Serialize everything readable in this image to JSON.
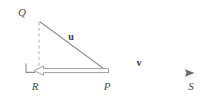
{
  "figure": {
    "points": [
      {
        "id": "Q",
        "label": "Q",
        "x": 39,
        "y": 21,
        "label_x": 25,
        "label_y": 15
      },
      {
        "id": "R",
        "label": "R",
        "x": 39,
        "y": 73,
        "label_x": 35,
        "label_y": 89
      },
      {
        "id": "P",
        "label": "P",
        "x": 109,
        "y": 73,
        "label_x": 106,
        "label_y": 89
      },
      {
        "id": "S",
        "label": "S",
        "x": 193,
        "y": 73,
        "label_x": 190,
        "label_y": 89
      }
    ],
    "vectors": [
      {
        "id": "u",
        "label": "u",
        "from": "P",
        "to": "Q",
        "label_x": 71,
        "label_y": 39
      },
      {
        "id": "v",
        "label": "v",
        "from": "P",
        "to": "S",
        "label_x": 139,
        "label_y": 65
      }
    ],
    "segments": {
      "baseline": {
        "x1": 8,
        "y1": 73,
        "x2": 212,
        "y2": 73
      },
      "hypotenuse": {
        "x1": 39,
        "y1": 21,
        "x2": 109,
        "y2": 73
      },
      "vertical_dashed": {
        "x1": 39,
        "y1": 21,
        "x2": 39,
        "y2": 73
      },
      "projection": {
        "x1": 109,
        "y1": 71,
        "x2": 41,
        "y2": 71
      }
    },
    "right_angle_marker": {
      "x": 26,
      "y": 62,
      "size": 10,
      "vertex": "R"
    },
    "colors": {
      "line": "#8a8a8a",
      "baseline": "#6e6e6e",
      "dashed": "#b9b9b9",
      "label": "#4a4a4a",
      "vector_label": "#3d3d3d",
      "background": "#ffffff"
    }
  }
}
